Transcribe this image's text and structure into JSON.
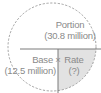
{
  "diagram": {
    "portion": {
      "label": "Portion",
      "value": "(30.8 million)"
    },
    "base": {
      "label": "Base",
      "value": "(12.5 million)"
    },
    "operator": "×",
    "rate": {
      "label": "Rate",
      "value": "(?)"
    },
    "colors": {
      "line": "#8c8c8c",
      "shade": "#e2e2e2",
      "text": "#8a8a8a"
    }
  }
}
